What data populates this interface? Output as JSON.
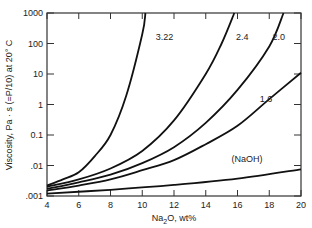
{
  "chart_data": {
    "type": "line",
    "title": "",
    "xlabel": "Na2O, wt%",
    "ylabel": "Viscosity, Pa · s (=P/10) at 20° C",
    "xlim": [
      4,
      20
    ],
    "ylim": [
      0.001,
      1000
    ],
    "yscale": "log",
    "x_ticks": [
      "4",
      "6",
      "8",
      "10",
      "12",
      "14",
      "16",
      "18",
      "20"
    ],
    "y_ticks": [
      ".001",
      ".01",
      "0.1",
      "1",
      "10",
      "100",
      "1000"
    ],
    "grid": false,
    "series": [
      {
        "name": "3.22",
        "x": [
          4,
          5,
          6,
          7,
          8,
          9,
          10,
          10.2
        ],
        "y": [
          0.0022,
          0.0035,
          0.006,
          0.02,
          0.1,
          2,
          200,
          1000
        ]
      },
      {
        "name": "2.4",
        "x": [
          4,
          6,
          8,
          10,
          12,
          14,
          15,
          15.8
        ],
        "y": [
          0.002,
          0.0035,
          0.008,
          0.03,
          0.3,
          10,
          100,
          1000
        ]
      },
      {
        "name": "2.0",
        "x": [
          4,
          6,
          8,
          10,
          12,
          14,
          16,
          18,
          18.9
        ],
        "y": [
          0.0017,
          0.0028,
          0.005,
          0.012,
          0.04,
          0.25,
          3,
          80,
          1000
        ]
      },
      {
        "name": "1.6",
        "x": [
          4,
          6,
          8,
          10,
          12,
          14,
          16,
          18,
          20
        ],
        "y": [
          0.0015,
          0.0022,
          0.0035,
          0.007,
          0.015,
          0.05,
          0.2,
          1.5,
          11
        ]
      },
      {
        "name": "(NaOH)",
        "x": [
          4,
          8,
          12,
          16,
          20
        ],
        "y": [
          0.0012,
          0.0016,
          0.0023,
          0.0037,
          0.0075
        ]
      }
    ],
    "annotations": [
      {
        "text": "3.22",
        "x": 11.4,
        "y": 160
      },
      {
        "text": "2.4",
        "x": 16.3,
        "y": 160
      },
      {
        "text": "2.0",
        "x": 18.6,
        "y": 160
      },
      {
        "text": "1.6",
        "x": 17.8,
        "y": 1.5
      },
      {
        "text": "(NaOH)",
        "x": 16.6,
        "y": 0.016
      }
    ]
  }
}
